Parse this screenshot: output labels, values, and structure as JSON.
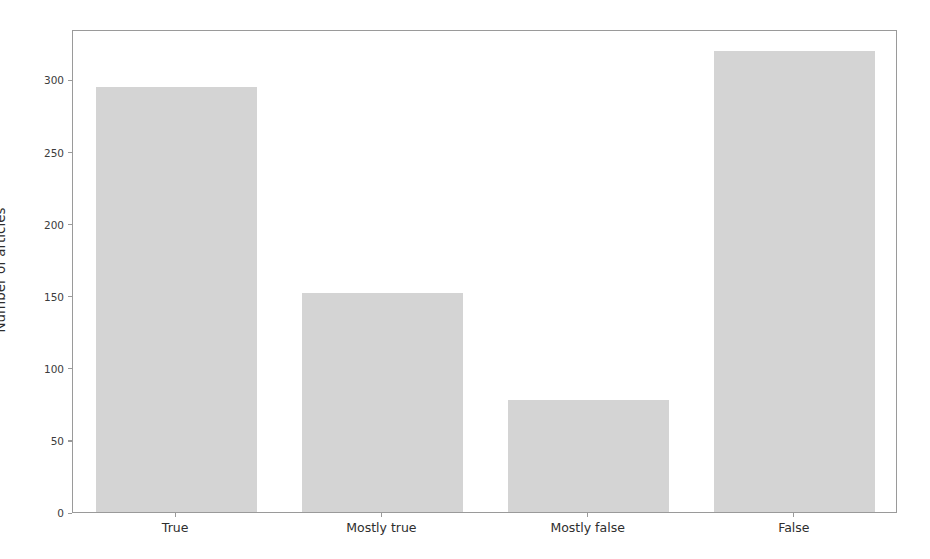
{
  "chart_data": {
    "type": "bar",
    "title": "",
    "subtitle": "",
    "xlabel": "",
    "ylabel": "Number of articles",
    "categories": [
      "True",
      "Mostly true",
      "Mostly false",
      "False"
    ],
    "values": [
      295,
      152,
      78,
      320
    ],
    "series": [
      {
        "name": "Number of articles",
        "values": [
          295,
          152,
          78,
          320
        ]
      }
    ],
    "ylim": [
      0,
      335
    ],
    "xlim": [
      -0.5,
      3.5
    ],
    "yticks": [
      0,
      50,
      100,
      150,
      200,
      250,
      300
    ],
    "ytick_labels": [
      "0",
      "50",
      "100",
      "150",
      "200",
      "250",
      "300"
    ],
    "xtick_labels": [
      "True",
      "Mostly true",
      "Mostly false",
      "False"
    ],
    "grid": false,
    "legend": false,
    "legend_position": "none",
    "annotations": [],
    "colors": {
      "bar_fill": "#d4d4d4",
      "axis_line": "#9a9a9a",
      "tick_label": "#3c3c3c",
      "axis_label": "#2e2e2e",
      "background": "#ffffff"
    },
    "bar_width_fraction": 0.78
  }
}
